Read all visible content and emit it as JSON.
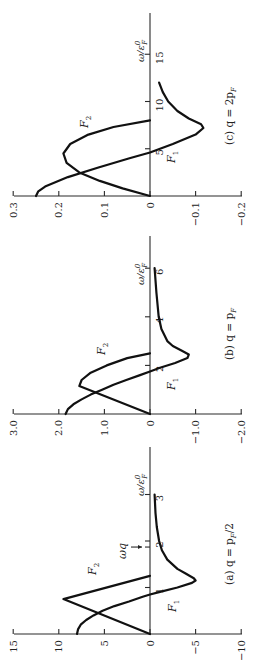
{
  "figure": {
    "rotation_deg": -90,
    "background": "#ffffff",
    "ink": "#111111"
  },
  "chart_data": [
    {
      "type": "line",
      "panel": "a",
      "caption": "(a) q = p_F/2",
      "caption_text": "(a) q = p",
      "caption_sub": "F",
      "caption_tail": "/2",
      "xlabel": "ω/ε°F",
      "ylabel": "",
      "x_ticks": [
        1,
        2,
        3
      ],
      "y_ticks": [
        15,
        10,
        5,
        0,
        -5,
        -10
      ],
      "y_tick_labels": [
        "15",
        "10",
        "5",
        "0",
        "−5",
        "−10"
      ],
      "xlim": [
        0,
        3.9
      ],
      "ylim": [
        -10,
        15
      ],
      "annotation": {
        "label": "ωq",
        "x": 1.87
      },
      "series": [
        {
          "name": "F1",
          "x": [
            0,
            0.1,
            0.2,
            0.3,
            0.4,
            0.5,
            0.6,
            0.7,
            0.8,
            0.85,
            0.9,
            1.0,
            1.1,
            1.15,
            1.2,
            1.3,
            1.4,
            1.6,
            1.8,
            2.0,
            2.3,
            2.6,
            3.0
          ],
          "y": [
            8.0,
            7.9,
            7.6,
            7.0,
            6.2,
            5.2,
            3.9,
            2.3,
            0.8,
            0.0,
            -1.0,
            -3.0,
            -4.6,
            -5.0,
            -4.8,
            -3.9,
            -3.0,
            -1.9,
            -1.3,
            -1.0,
            -0.75,
            -0.6,
            -0.5
          ]
        },
        {
          "name": "F2",
          "x": [
            0,
            0.75,
            1.25
          ],
          "y": [
            0,
            9.5,
            0
          ]
        }
      ],
      "grid": false,
      "legend": "inline labels"
    },
    {
      "type": "line",
      "panel": "b",
      "caption": "(b) q = p_F",
      "caption_text": "(b) q = p",
      "caption_sub": "F",
      "caption_tail": "",
      "xlabel": "ω/ε°F",
      "ylabel": "",
      "x_ticks": [
        2,
        4,
        6
      ],
      "y_ticks": [
        3.0,
        2.0,
        1.0,
        0,
        -1.0,
        -2.0
      ],
      "y_tick_labels": [
        "3.0",
        "2.0",
        "1.0",
        "0",
        "−1.0",
        "−2.0"
      ],
      "xlim": [
        0,
        7.2
      ],
      "ylim": [
        -2.0,
        3.0
      ],
      "series": [
        {
          "name": "F1",
          "x": [
            0,
            0.2,
            0.4,
            0.6,
            0.8,
            1.0,
            1.2,
            1.4,
            1.6,
            1.75,
            1.9,
            2.1,
            2.3,
            2.45,
            2.6,
            2.8,
            3.0,
            3.5,
            4.0,
            5.0,
            6.0
          ],
          "y": [
            1.85,
            1.8,
            1.68,
            1.5,
            1.3,
            1.05,
            0.8,
            0.52,
            0.22,
            0.0,
            -0.22,
            -0.55,
            -0.82,
            -0.85,
            -0.7,
            -0.5,
            -0.38,
            -0.25,
            -0.19,
            -0.14,
            -0.1
          ]
        },
        {
          "name": "F2",
          "x": [
            0,
            1.15,
            1.4,
            1.7,
            2.0,
            2.3,
            2.5
          ],
          "y": [
            0,
            1.55,
            1.5,
            1.3,
            0.95,
            0.5,
            0
          ]
        }
      ],
      "grid": false,
      "legend": "inline labels"
    },
    {
      "type": "line",
      "panel": "c",
      "caption": "(c) q = 2p_F",
      "caption_text": "(c) q = 2p",
      "caption_sub": "F",
      "caption_tail": "",
      "xlabel": "ω/ε°F",
      "ylabel": "",
      "x_ticks": [
        5,
        10,
        15
      ],
      "y_ticks": [
        0.3,
        0.2,
        0.1,
        0,
        -0.1,
        -0.2
      ],
      "y_tick_labels": [
        "0.3",
        "0.2",
        "0.1",
        "0",
        "−0.1",
        "−0.2"
      ],
      "xlim": [
        0,
        19.3
      ],
      "ylim": [
        -0.2,
        0.3
      ],
      "series": [
        {
          "name": "F1",
          "x": [
            0,
            0.5,
            1.0,
            2.0,
            3.0,
            4.0,
            4.6,
            5.5,
            6.5,
            7.2,
            7.6,
            8.2,
            9.0,
            10.0,
            11.0,
            12.0
          ],
          "y": [
            0.25,
            0.245,
            0.23,
            0.18,
            0.115,
            0.045,
            0.0,
            -0.05,
            -0.1,
            -0.117,
            -0.112,
            -0.085,
            -0.06,
            -0.04,
            -0.028,
            -0.02
          ]
        },
        {
          "name": "F2",
          "x": [
            0,
            0.8,
            1.6,
            2.5,
            3.5,
            4.5,
            5.5,
            6.5,
            7.3,
            8.0
          ],
          "y": [
            0,
            0.06,
            0.11,
            0.155,
            0.183,
            0.19,
            0.175,
            0.135,
            0.08,
            0
          ]
        }
      ],
      "grid": false,
      "legend": "inline labels"
    }
  ],
  "labels": {
    "F1": "F",
    "F1_sub": "1",
    "F2": "F",
    "F2_sub": "2",
    "omega_axis": "ω/ε",
    "omega_sup": "0",
    "omega_sub": "F",
    "omega_q": "ωq"
  }
}
